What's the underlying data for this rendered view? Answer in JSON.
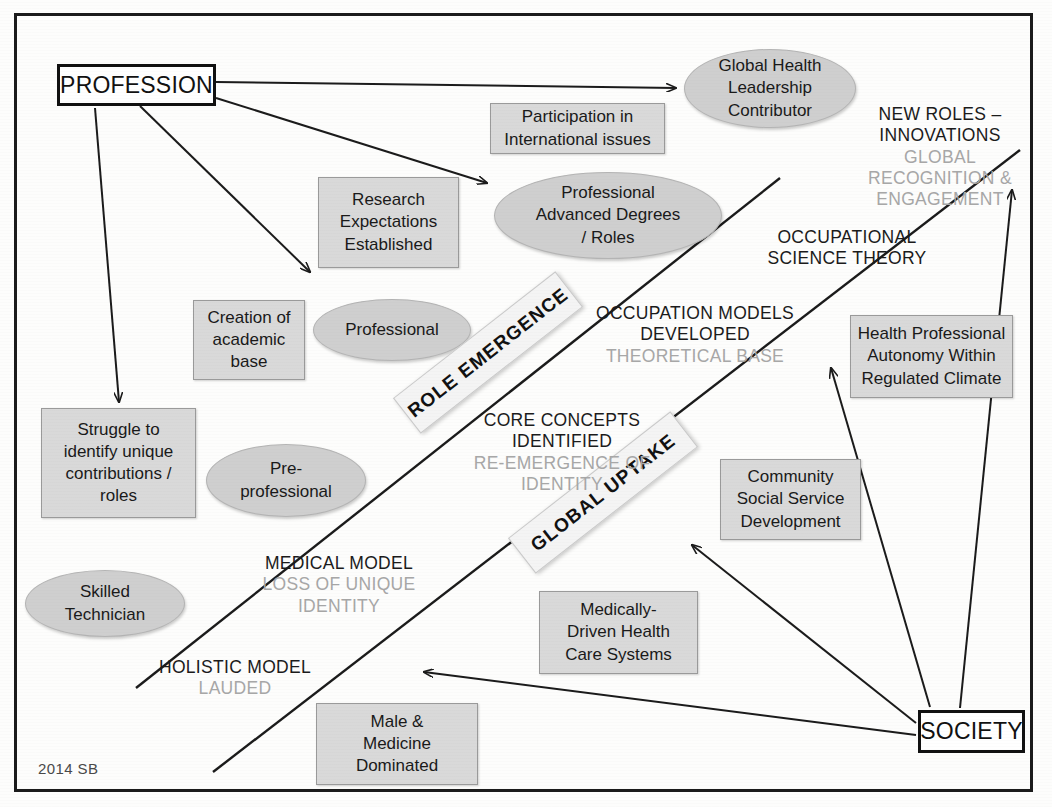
{
  "diagram": {
    "signature": "2014 SB",
    "colors": {
      "ellipse_fill": "#cfcfcf",
      "box_fill": "#d9d9d9",
      "banner_fill": "#f4f4f4",
      "line": "#1b1b1b",
      "dark_text": "#1b1b1b",
      "light_text": "#a7a7a7"
    }
  },
  "anchors": {
    "profession": "PROFESSION",
    "society": "SOCIETY"
  },
  "ellipses": [
    {
      "id": "global-health-leadership-contributor",
      "lines": [
        "Global Health",
        "Leadership",
        "Contributor"
      ]
    },
    {
      "id": "professional-advanced-degrees-roles",
      "lines": [
        "Professional",
        "Advanced Degrees",
        "/ Roles"
      ]
    },
    {
      "id": "professional",
      "lines": [
        "Professional"
      ]
    },
    {
      "id": "pre-professional",
      "lines": [
        "Pre-",
        "professional"
      ]
    },
    {
      "id": "skilled-technician",
      "lines": [
        "Skilled",
        "Technician"
      ]
    }
  ],
  "boxes": [
    {
      "id": "participation-international-issues",
      "lines": [
        "Participation in",
        "International issues"
      ]
    },
    {
      "id": "research-expectations-established",
      "lines": [
        "Research",
        "Expectations",
        "Established"
      ]
    },
    {
      "id": "creation-of-academic-base",
      "lines": [
        "Creation of",
        "academic",
        "base"
      ]
    },
    {
      "id": "struggle-identify-unique-contributions",
      "lines": [
        "Struggle to",
        "identify unique",
        "contributions /",
        "roles"
      ]
    },
    {
      "id": "health-professional-autonomy",
      "lines": [
        "Health Professional",
        "Autonomy Within",
        "Regulated Climate"
      ]
    },
    {
      "id": "community-social-service-development",
      "lines": [
        "Community",
        "Social Service",
        "Development"
      ]
    },
    {
      "id": "medically-driven-health-care-systems",
      "lines": [
        "Medically-",
        "Driven Health",
        "Care Systems"
      ]
    },
    {
      "id": "male-medicine-dominated",
      "lines": [
        "Male &",
        "Medicine",
        "Dominated"
      ]
    }
  ],
  "banners": [
    {
      "id": "role-emergence",
      "label": "ROLE EMERGENCE"
    },
    {
      "id": "global-uptake",
      "label": "GLOBAL UPTAKE"
    }
  ],
  "captions": [
    {
      "id": "new-roles-innovations",
      "dark": [
        "NEW ROLES –",
        "INNOVATIONS"
      ],
      "light": [
        "GLOBAL",
        "RECOGNITION &",
        "ENGAGEMENT"
      ]
    },
    {
      "id": "occupational-science-theory",
      "dark": [
        "OCCUPATIONAL",
        "SCIENCE THEORY"
      ],
      "light": []
    },
    {
      "id": "occupation-models-developed",
      "dark": [
        "OCCUPATION MODELS",
        "DEVELOPED"
      ],
      "light": [
        "THEORETICAL BASE"
      ]
    },
    {
      "id": "core-concepts-identified",
      "dark": [
        "CORE CONCEPTS",
        "IDENTIFIED"
      ],
      "light": [
        "RE-EMERGENCE OF",
        "IDENTITY"
      ]
    },
    {
      "id": "medical-model",
      "dark": [
        "MEDICAL MODEL"
      ],
      "light": [
        "LOSS OF UNIQUE",
        "IDENTITY"
      ]
    },
    {
      "id": "holistic-model",
      "dark": [
        "HOLISTIC MODEL"
      ],
      "light": [
        "LAUDED"
      ]
    }
  ]
}
